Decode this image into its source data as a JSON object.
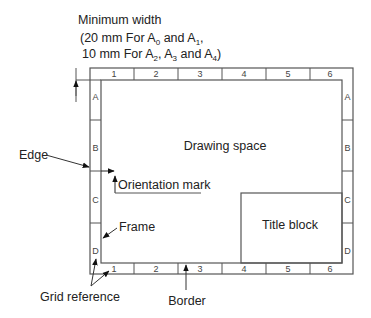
{
  "diagram": {
    "min_width_note": {
      "line1": "Minimum width",
      "line2_prefix": "(20 mm For A",
      "line2_sub1": "0",
      "line2_mid": " and A",
      "line2_sub2": "1",
      "line2_suffix": ",",
      "line3_prefix": "10 mm For A",
      "line3_sub1": "2",
      "line3_mid1": ", A",
      "line3_sub2": "3",
      "line3_mid2": " and A",
      "line3_sub3": "4",
      "line3_suffix": ")"
    },
    "columns": [
      "1",
      "2",
      "3",
      "4",
      "5",
      "6"
    ],
    "rows": [
      "A",
      "B",
      "C",
      "D"
    ],
    "regions": {
      "drawing_space": "Drawing space",
      "title_block": "Title block"
    },
    "callouts": {
      "edge": "Edge",
      "orientation_mark": "Orientation mark",
      "frame": "Frame",
      "grid_reference": "Grid reference",
      "border": "Border"
    },
    "colors": {
      "line": "#555555",
      "text": "#222222",
      "background": "#ffffff"
    }
  }
}
